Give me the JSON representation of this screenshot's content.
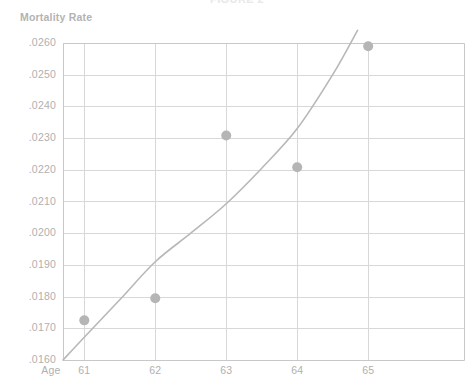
{
  "chart_data": {
    "type": "scatter",
    "title": "FIGURE 2",
    "xlabel": "Age",
    "ylabel": "Mortality Rate",
    "x": [
      61,
      62,
      63,
      64,
      65
    ],
    "categories": [
      "61",
      "62",
      "63",
      "64",
      "65"
    ],
    "xticklabels": [
      "61",
      "62",
      "63",
      "64",
      "65"
    ],
    "yticklabels": [
      ".0260",
      ".0250",
      ".0240",
      ".0230",
      ".0220",
      ".0210",
      ".0200",
      ".0190",
      ".0180",
      ".0170",
      ".0160"
    ],
    "ytickvalues": [
      0.026,
      0.025,
      0.024,
      0.023,
      0.022,
      0.021,
      0.02,
      0.019,
      0.018,
      0.017,
      0.016
    ],
    "xlim": [
      60.7,
      66.35
    ],
    "ylim": [
      0.016,
      0.026
    ],
    "grid": true,
    "legend": false,
    "series": [
      {
        "name": "Observed mortality rate",
        "type": "scatter",
        "marker": "circle",
        "color": "#b5b5b5",
        "values": [
          0.01725,
          0.01795,
          0.02308,
          0.02208,
          0.0259
        ]
      },
      {
        "name": "Fitted curve",
        "type": "line",
        "color": "#b8b8b8",
        "x": [
          60.7,
          61.0,
          61.5,
          62.0,
          62.5,
          63.0,
          63.5,
          64.0,
          64.5,
          64.85
        ],
        "values": [
          0.016,
          0.01672,
          0.0179,
          0.0191,
          0.02,
          0.02093,
          0.02205,
          0.0233,
          0.025,
          0.0264
        ]
      }
    ]
  },
  "axes": {
    "y_title": "Mortality Rate",
    "x_title": "Age"
  },
  "colors": {
    "marker": "#b5b5b5",
    "curve": "#b8b8b8",
    "grid": "#d8d8d8",
    "axis": "#c8c8c8",
    "text": "#b0b0b0",
    "background": "#ffffff"
  }
}
